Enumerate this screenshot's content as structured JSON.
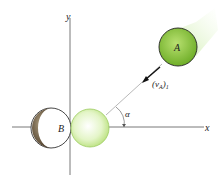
{
  "diagram": {
    "axes": {
      "x_label": "x",
      "y_label": "y"
    },
    "ball_a": {
      "label": "A",
      "color": "#8cc43c"
    },
    "ball_b": {
      "label": "B",
      "color": "#6b5a44"
    },
    "ghost_ball": {
      "color": "#d8f0b0"
    },
    "velocity": {
      "symbol": "(v",
      "subscript_a": "A",
      "suffix": ")",
      "subscript_1": "1"
    },
    "angle": {
      "label": "α"
    }
  }
}
